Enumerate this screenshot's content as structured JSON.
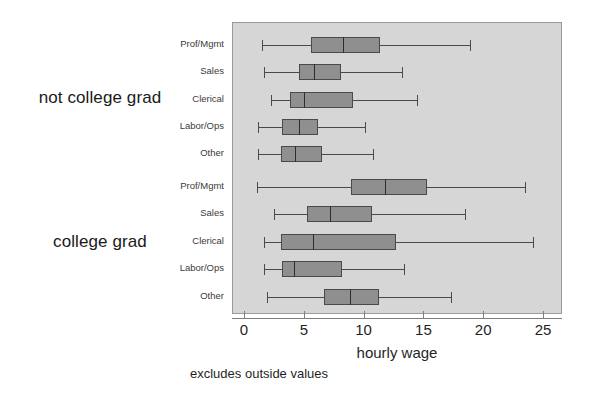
{
  "chart_data": {
    "type": "box",
    "title": "",
    "xlabel": "hourly wage",
    "ylabel": "",
    "xlim": [
      0,
      26.5
    ],
    "xticks": [
      0,
      5,
      10,
      15,
      20,
      25
    ],
    "xtick_labels": [
      "0",
      "5",
      "10",
      "15",
      "20",
      "25"
    ],
    "grid": false,
    "legend": "none",
    "footnote": "excludes outside values",
    "orientation": "horizontal",
    "categories": [
      "Prof/Mgmt",
      "Sales",
      "Clerical",
      "Labor/Ops",
      "Other"
    ],
    "groups": [
      {
        "label": "not college grad",
        "boxes": [
          {
            "category": "Prof/Mgmt",
            "min": 1.4,
            "q1": 5.5,
            "median": 8.2,
            "q3": 11.3,
            "max": 18.8
          },
          {
            "category": "Sales",
            "min": 1.6,
            "q1": 4.5,
            "median": 5.8,
            "q3": 8.0,
            "max": 13.1
          },
          {
            "category": "Clerical",
            "min": 2.2,
            "q1": 3.8,
            "median": 4.9,
            "q3": 9.0,
            "max": 14.4
          },
          {
            "category": "Labor/Ops",
            "min": 1.1,
            "q1": 3.1,
            "median": 4.5,
            "q3": 6.1,
            "max": 10.0
          },
          {
            "category": "Other",
            "min": 1.1,
            "q1": 3.0,
            "median": 4.2,
            "q3": 6.4,
            "max": 10.7
          }
        ]
      },
      {
        "label": "college grad",
        "boxes": [
          {
            "category": "Prof/Mgmt",
            "min": 1.0,
            "q1": 8.9,
            "median": 11.7,
            "q3": 15.2,
            "max": 23.4
          },
          {
            "category": "Sales",
            "min": 2.4,
            "q1": 5.2,
            "median": 7.1,
            "q3": 10.6,
            "max": 18.4
          },
          {
            "category": "Clerical",
            "min": 1.6,
            "q1": 3.0,
            "median": 5.7,
            "q3": 12.6,
            "max": 24.1
          },
          {
            "category": "Labor/Ops",
            "min": 1.6,
            "q1": 3.1,
            "median": 4.1,
            "q3": 8.1,
            "max": 13.3
          },
          {
            "category": "Other",
            "min": 1.8,
            "q1": 6.6,
            "median": 8.8,
            "q3": 11.2,
            "max": 17.2
          }
        ]
      }
    ],
    "colors": {
      "panel_background": "#d6d6d6",
      "box_fill": "#8f8f8f",
      "box_stroke": "#4a4a4a",
      "median_stroke": "#2d2d2d",
      "axis": "#7d7d7d",
      "text": "#1f1f1f"
    }
  }
}
